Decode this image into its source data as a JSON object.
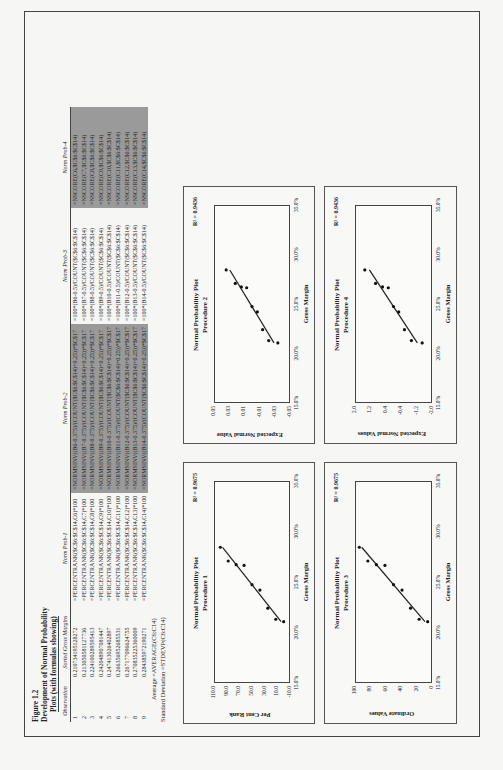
{
  "figure": {
    "label": "Figure 1.2",
    "title_line1": "Development of Normal Probability",
    "title_line2": "Plots (with formulas showing)"
  },
  "table": {
    "headers": [
      "Observation",
      "Sorted Gross Margins",
      "Norm Prob-1",
      "Norm Prob-2",
      "Norm Prob-3",
      "Norm Prob-4"
    ],
    "rows": [
      [
        "1",
        "0.210734195128272",
        "=PERCENTRANK($C$6:$C$14,C6)*100",
        "=NORMSINV((B6-0.375)/(COUNT($C$6:$C$14)+0.25))*$C$17",
        "=100*(B6-0.5)/COUNT($C$6:$C$14)",
        "=NSCORE(C6,$C$6:$C$14)"
      ],
      [
        "2",
        "0.213050581127736",
        "=PERCENTRANK($C$6:$C$14,C7)*100",
        "=NORMSINV((B7-0.375)/(COUNT($C$6:$C$14)+0.25))*$C$17",
        "=100*(B7-0.5)/COUNT($C$6:$C$14)",
        "=NSCORE(C7,$C$6:$C$14)"
      ],
      [
        "3",
        "0.224100289595413",
        "=PERCENTRANK($C$6:$C$14,C8)*100",
        "=NORMSINV((B8-0.375)/(COUNT($C$6:$C$14)+0.25))*$C$17",
        "=100*(B8-0.5)/COUNT($C$6:$C$14)",
        "=NSCORE(C8,$C$6:$C$14)"
      ],
      [
        "4",
        "0.242048907081447",
        "=PERCENTRANK($C$6:$C$14,C9)*100",
        "=NORMSINV((B9-0.375)/(COUNT($C$6:$C$14)+0.25))*$C$17",
        "=100*(B9-0.5)/COUNT($C$6:$C$14)",
        "=NSCORE(C9,$C$6:$C$14)"
      ],
      [
        "5",
        "0.247413026402897",
        "=PERCENTRANK($C$6:$C$14,C10)*100",
        "=NORMSINV((B10-0.375)/(COUNT($C$6:$C$14)+0.25))*$C$17",
        "=100*(B10-0.5)/COUNT($C$6:$C$14)",
        "=NSCORE(C10,$C$6:$C$14)"
      ],
      [
        "6",
        "0.266356952685531",
        "=PERCENTRANK($C$6:$C$14,C11)*100",
        "=NORMSINV((B11-0.375)/(COUNT($C$6:$C$14)+0.25))*$C$17",
        "=100*(B11-0.5)/COUNT($C$6:$C$14)",
        "=NSCORE(C11,$C$6:$C$14)"
      ],
      [
        "7",
        "0.267177096624755",
        "=PERCENTRANK($C$6:$C$14,C12)*100",
        "=NORMSINV((B12-0.375)/(COUNT($C$6:$C$14)+0.25))*$C$17",
        "=100*(B12-0.5)/COUNT($C$6:$C$14)",
        "=NSCORE(C12,$C$6:$C$14)"
      ],
      [
        "8",
        "0.270835225360009",
        "=PERCENTRANK($C$6:$C$14,C13)*100",
        "=NORMSINV((B13-0.375)/(COUNT($C$6:$C$14)+0.25))*$C$17",
        "=100*(B13-0.5)/COUNT($C$6:$C$14)",
        "=NSCORE(C13,$C$6:$C$14)"
      ],
      [
        "9",
        "0.284385972190271",
        "=PERCENTRANK($C$6:$C$14,C14)*100",
        "=NORMSINV((B14-0.375)/(COUNT($C$6:$C$14)+0.25))*$C$17",
        "=100*(B14-0.5)/COUNT($C$6:$C$14)",
        "=NSCORE(C14,$C$6:$C$14)"
      ]
    ]
  },
  "stats": {
    "average_label": "Average",
    "average_formula": "=AVERAGE(C6:C14)",
    "stdev_label": "Standard Deviation",
    "stdev_formula": "=STDEVP(C6:C14)"
  },
  "colors": {
    "highlight_column": "#9a9a9a",
    "frame": "#444444",
    "background": "#f6f6f5"
  },
  "chart_data": [
    {
      "type": "scatter",
      "title": "Normal Probability Plot",
      "subtitle": "Procedure 1",
      "r2_label": "R² = 0.9675",
      "xlabel": "Gross Margin",
      "ylabel": "Per Cent Rank",
      "xlim": [
        0.15,
        0.35
      ],
      "ylim": [
        -10,
        110
      ],
      "xticks": [
        "15.0%",
        "20.0%",
        "25.0%",
        "30.0%",
        "35.0%"
      ],
      "yticks": [
        "110.0",
        "90.0",
        "70.0",
        "50.0",
        "30.0",
        "10.0",
        "-10.0"
      ],
      "x": [
        0.2107,
        0.2131,
        0.2241,
        0.242,
        0.2474,
        0.2664,
        0.2672,
        0.2708,
        0.2844
      ],
      "y": [
        0,
        12.5,
        25,
        37.5,
        50,
        62.5,
        75,
        87.5,
        100
      ],
      "trendline": true
    },
    {
      "type": "scatter",
      "title": "Normal Probability Plot",
      "subtitle": "Procedure 2",
      "r2_label": "R² = 0.9436",
      "xlabel": "Gross Margin",
      "ylabel": "Expected Normal Value",
      "xlim": [
        0.15,
        0.35
      ],
      "ylim": [
        -0.05,
        0.05
      ],
      "xticks": [
        "15.0%",
        "20.0%",
        "25.0%",
        "30.0%",
        "35.0%"
      ],
      "yticks": [
        "0.05",
        "0.03",
        "0.01",
        "-0.01",
        "-0.03",
        "-0.05"
      ],
      "x": [
        0.2107,
        0.2131,
        0.2241,
        0.242,
        0.2474,
        0.2664,
        0.2672,
        0.2708,
        0.2844
      ],
      "y": [
        -0.034,
        -0.022,
        -0.014,
        -0.007,
        0.0,
        0.007,
        0.014,
        0.022,
        0.034
      ],
      "trendline": true
    },
    {
      "type": "scatter",
      "title": "Normal Probability Plot",
      "subtitle": "Procedure 3",
      "r2_label": "R² = 0.9675",
      "xlabel": "Gross Margin",
      "ylabel": "Ordinate Values",
      "xlim": [
        0.15,
        0.35
      ],
      "ylim": [
        0,
        100
      ],
      "xticks": [
        "15.0%",
        "20.0%",
        "25.0%",
        "30.0%",
        "35.0%"
      ],
      "yticks": [
        "100",
        "80",
        "60",
        "40",
        "20",
        "0"
      ],
      "x": [
        0.2107,
        0.2131,
        0.2241,
        0.242,
        0.2474,
        0.2664,
        0.2672,
        0.2708,
        0.2844
      ],
      "y": [
        5.6,
        16.7,
        27.8,
        38.9,
        50,
        61.1,
        72.2,
        83.3,
        94.4
      ],
      "trendline": true
    },
    {
      "type": "scatter",
      "title": "Normal Probability Plot",
      "subtitle": "Procedure 4",
      "r2_label": "R² = 0.9436",
      "xlabel": "Gross Margin",
      "ylabel": "Expected Normal Values",
      "xlim": [
        0.15,
        0.35
      ],
      "ylim": [
        -2.0,
        2.0
      ],
      "xticks": [
        "15.0%",
        "20.0%",
        "25.0%",
        "30.0%",
        "35.0%"
      ],
      "yticks": [
        "2.0",
        "1.2",
        "0.4",
        "-0.4",
        "-1.2",
        "-2.0"
      ],
      "x": [
        0.2107,
        0.2131,
        0.2241,
        0.242,
        0.2474,
        0.2664,
        0.2672,
        0.2708,
        0.2844
      ],
      "y": [
        -1.49,
        -0.93,
        -0.57,
        -0.27,
        0.0,
        0.27,
        0.57,
        0.93,
        1.49
      ],
      "trendline": true
    }
  ]
}
